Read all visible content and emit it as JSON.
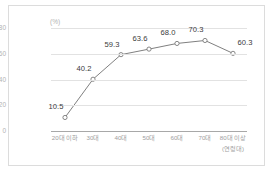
{
  "chart_data": {
    "type": "line",
    "title": "",
    "subtitle": "",
    "xlabel": "(연령대)",
    "ylabel": "(%)",
    "categories": [
      "20대 이하",
      "30대",
      "40대",
      "50대",
      "60대",
      "70대",
      "80대 이상"
    ],
    "values": [
      10.5,
      40.2,
      59.3,
      63.6,
      68.0,
      70.3,
      60.3
    ],
    "data_labels": [
      "10.5",
      "40.2",
      "59.3",
      "63.6",
      "68.0",
      "70.3",
      "60.3"
    ],
    "ylim": [
      0,
      80
    ],
    "yticks": [
      0,
      20,
      40,
      60,
      80
    ],
    "ytick_labels": [
      "0",
      "20",
      "40",
      "60",
      "80"
    ],
    "grid": true,
    "legend": false,
    "legend_position": "none",
    "series": [
      {
        "name": "비율",
        "values": [
          10.5,
          40.2,
          59.3,
          63.6,
          68.0,
          70.3,
          60.3
        ],
        "color": "#808080",
        "marker": "open-circle"
      }
    ]
  },
  "colors": {
    "line": "#808080",
    "marker_fill": "#ffffff",
    "marker_stroke": "#7a7a7a",
    "gridline": "#e2e2e2",
    "axis": "#a8a8a8",
    "tick_text": "#b2b2b2",
    "xtick_text": "#9e9e9e",
    "label_text": "#3a3a3a",
    "frame_border": "#dcdcdc",
    "background": "#ffffff"
  }
}
